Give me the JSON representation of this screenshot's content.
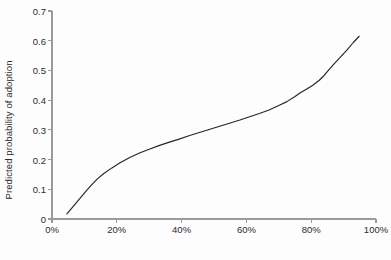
{
  "chart_data": {
    "type": "line",
    "title": "",
    "xlabel": "Percent favoring proposed policy change",
    "ylabel": "Predicted probability of adoption",
    "xlim": [
      0,
      100
    ],
    "ylim": [
      0,
      0.7
    ],
    "grid": false,
    "legend": null,
    "legend_position": "none",
    "xticks": [
      0,
      20,
      40,
      60,
      80,
      100
    ],
    "xtick_labels": [
      "0%",
      "20%",
      "40%",
      "60%",
      "80%",
      "100%"
    ],
    "yticks": [
      0,
      0.1,
      0.2,
      0.3,
      0.4,
      0.5,
      0.6,
      0.7
    ],
    "ytick_labels": [
      "0",
      "0.1",
      "0.2",
      "0.3",
      "0.4",
      "0.5",
      "0.6",
      "0.7"
    ],
    "line_color": "#262626",
    "axis_color": "#9a9a9a",
    "background_color": "#fdfdfd",
    "series": [
      {
        "name": "Predicted probability of adoption",
        "x": [
          4.6,
          6.5,
          8.5,
          10.5,
          12.3,
          14.0,
          16.0,
          18.5,
          21.0,
          24.0,
          27.0,
          30.0,
          33.0,
          36.0,
          39.0,
          42.5,
          46.0,
          49.0,
          52.0,
          55.0,
          58.0,
          61.0,
          64.0,
          67.0,
          70.0,
          72.5,
          75.0,
          76.5,
          78.5,
          80.5,
          82.5,
          84.0,
          85.3,
          87.0,
          89.0,
          91.0,
          93.0,
          94.8
        ],
        "y": [
          0.017,
          0.042,
          0.068,
          0.094,
          0.116,
          0.135,
          0.153,
          0.172,
          0.189,
          0.207,
          0.222,
          0.235,
          0.247,
          0.258,
          0.268,
          0.281,
          0.293,
          0.303,
          0.313,
          0.323,
          0.333,
          0.344,
          0.355,
          0.367,
          0.382,
          0.395,
          0.412,
          0.424,
          0.437,
          0.45,
          0.467,
          0.483,
          0.5,
          0.521,
          0.545,
          0.568,
          0.594,
          0.615
        ]
      }
    ],
    "annotations": []
  }
}
